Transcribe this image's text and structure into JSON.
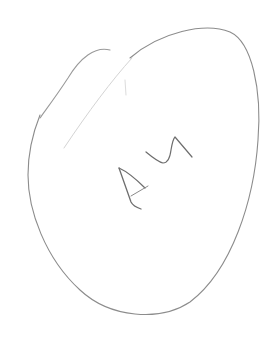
{
  "sketch": {
    "description": "Hand-drawn pencil sketch of an egg-shaped oval with handwritten characters inside",
    "handwritten_text": "A4",
    "colors": {
      "background": "#ffffff",
      "outline": "#8c8c8c",
      "faint_line": "#cfcfcf",
      "letters": "#6e6e6e"
    }
  }
}
